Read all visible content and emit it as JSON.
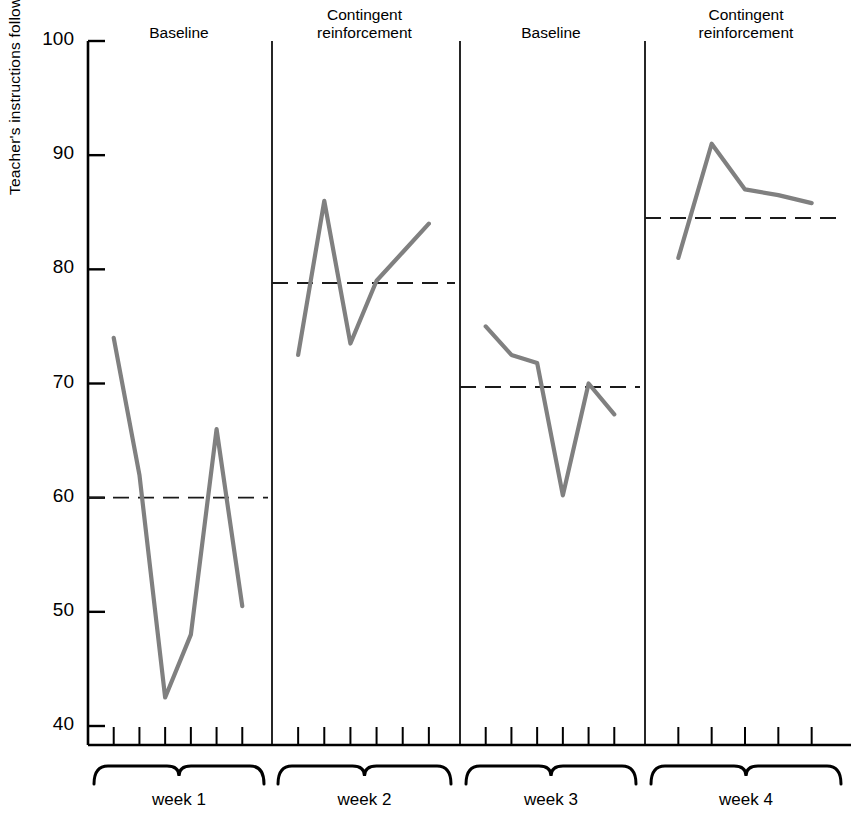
{
  "figure": {
    "background": "#ffffff",
    "line_color": "#808080",
    "axis_color": "#000000",
    "baseline_color": "#1a1a1a"
  },
  "axes": {
    "ylabel": "Teacher's instructions followed, percent",
    "ytick_labels": [
      "100",
      "90",
      "80",
      "70",
      "60",
      "50",
      "40"
    ],
    "ytick_values": [
      100,
      90,
      80,
      70,
      60,
      50,
      40
    ],
    "ymin": 38.3,
    "ymax": 100,
    "xlabel": ""
  },
  "phase_titles": [
    {
      "label_line1": "Baseline",
      "label_line2": ""
    },
    {
      "label_line1": "Contingent",
      "label_line2": "reinforcement"
    },
    {
      "label_line1": "Baseline",
      "label_line2": ""
    },
    {
      "label_line1": "Contingent",
      "label_line2": "reinforcement"
    }
  ],
  "week_labels": [
    "week 1",
    "week 2",
    "week 3",
    "week 4"
  ],
  "chart_data": {
    "type": "line",
    "title": "",
    "xlabel": "",
    "ylabel": "Teacher's instructions followed, percent",
    "ylim": [
      38.3,
      100
    ],
    "yticks": [
      40,
      50,
      60,
      70,
      80,
      90,
      100
    ],
    "grid": false,
    "legend": "none",
    "panels": [
      {
        "name": "week 1",
        "condition": "Baseline",
        "sessions": [
          1,
          2,
          3,
          4,
          5,
          6
        ],
        "values": [
          74.0,
          62.0,
          42.5,
          48.0,
          66.0,
          50.5
        ],
        "phase_mean_line": 60.0
      },
      {
        "name": "week 2",
        "condition": "Contingent reinforcement",
        "sessions": [
          1,
          2,
          3,
          4,
          5,
          6
        ],
        "values": [
          72.5,
          86.0,
          73.5,
          79.0,
          81.5,
          84.0
        ],
        "phase_mean_line": 78.8
      },
      {
        "name": "week 3",
        "condition": "Baseline",
        "sessions": [
          1,
          2,
          3,
          4,
          5,
          6
        ],
        "values": [
          75.0,
          72.5,
          71.8,
          60.2,
          70.0,
          67.3
        ],
        "phase_mean_line": 69.7
      },
      {
        "name": "week 4",
        "condition": "Contingent reinforcement",
        "sessions": [
          1,
          2,
          3,
          4,
          5
        ],
        "values": [
          81.0,
          91.0,
          87.0,
          86.5,
          85.8
        ],
        "phase_mean_line": 84.5
      }
    ]
  }
}
